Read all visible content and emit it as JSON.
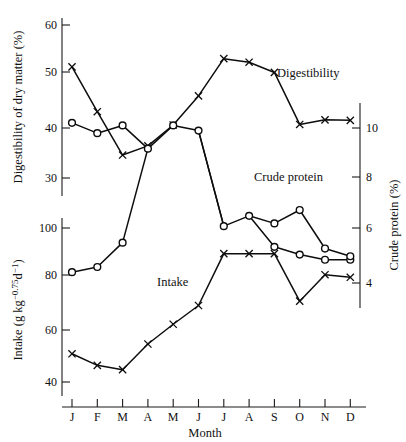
{
  "chart_data": {
    "type": "line",
    "title": "",
    "xlabel": "Month",
    "categories": [
      "J",
      "F",
      "M",
      "A",
      "M",
      "J",
      "J",
      "A",
      "S",
      "O",
      "N",
      "D"
    ],
    "axes": {
      "left_upper": {
        "label": "Digestibility of dry matter (%)",
        "ticks": [
          30,
          40,
          50,
          60
        ],
        "ylim": [
          28,
          62
        ],
        "grid": false
      },
      "left_lower": {
        "label": "Intake (g kg−0.75 d−1)",
        "label_plain": "Intake (g kg-0.75 d-1)",
        "ticks": [
          40,
          60,
          80,
          100
        ],
        "ylim": [
          36,
          104
        ],
        "grid": false
      },
      "right": {
        "label": "Crude protein (%)",
        "ticks": [
          4,
          6,
          8,
          10
        ],
        "ylim": [
          3.2,
          11.2
        ],
        "grid": false
      }
    },
    "series": [
      {
        "name": "Digestibility",
        "marker": "x",
        "axis": "left_upper",
        "unit": "%",
        "values": [
          51.8,
          43.0,
          34.5,
          36.3,
          40.4,
          46.1,
          53.4,
          52.7,
          50.7,
          40.5,
          41.4,
          41.3
        ]
      },
      {
        "name": "Crude protein",
        "marker": "circle",
        "axis": "right",
        "unit": "%",
        "values": [
          10.2,
          9.8,
          10.1,
          9.2,
          10.1,
          9.9,
          6.2,
          6.6,
          5.4,
          5.1,
          4.9,
          4.9
        ],
        "values_in_left_upper_scale": [
          41.4,
          39.2,
          40.0,
          33.9,
          39.8,
          38.4,
          null,
          null,
          null,
          null,
          null,
          null
        ]
      },
      {
        "name": "Intake",
        "marker": "x",
        "axis": "left_lower",
        "unit": "g kg-0.75 d-1",
        "values": [
          51.0,
          46.5,
          44.8,
          54.8,
          62.5,
          69.8,
          90.0,
          90.0,
          90.0,
          71.5,
          81.8,
          80.8
        ]
      },
      {
        "name": "Crude protein (lower segment)",
        "marker": "circle",
        "axis": "left_lower",
        "unit": "g kg-0.75 d-1",
        "values": [
          82.8,
          84.8,
          94.3,
          null,
          null,
          null,
          null,
          null,
          101.8,
          107.0,
          92.0,
          89.0
        ]
      }
    ],
    "annotations": [
      {
        "text": "Digestibility",
        "x": 0.72,
        "y_px": 73
      },
      {
        "text": "Crude protein",
        "x": 0.6,
        "y_px": 177
      },
      {
        "text": "Intake",
        "x": 0.38,
        "y_px": 282
      }
    ],
    "legend": "inline-labels",
    "colors": {
      "line": "#0d0d0d",
      "axis": "#1a1a1a",
      "background": "#ffffff"
    }
  },
  "labels": {
    "y_left_upper": "Digestibility of dry matter (%)",
    "y_left_lower_head": "Intake (g kg",
    "y_left_lower_sup1": "−0.75",
    "y_left_lower_mid": "d",
    "y_left_lower_sup2": "−1",
    "y_left_lower_tail": ")",
    "y_right": "Crude protein (%)",
    "x_axis": "Month",
    "series_digestibility": "Digestibility",
    "series_crude_protein": "Crude protein",
    "series_intake": "Intake"
  }
}
